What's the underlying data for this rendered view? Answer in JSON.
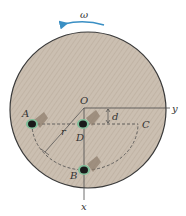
{
  "diagram": {
    "type": "rotating disk with bugs",
    "colors": {
      "disk_fill": "#c9bcae",
      "disk_edge": "#3a3a3a",
      "omega_arrow": "#3a8fc4",
      "lines": "#4a4a4a",
      "bug_body": "#1a1a1a",
      "bug_shadow": "#8b7a6a",
      "bug_legs": "#7fbf9a"
    },
    "labels": {
      "omega": "ω",
      "origin": "O",
      "y_axis": "y",
      "x_axis": "x",
      "distance": "d",
      "radius": "r",
      "point_a": "A",
      "point_b": "B",
      "point_c": "C",
      "point_d": "D"
    },
    "points": {
      "O": [
        84,
        108
      ],
      "A": [
        32,
        124
      ],
      "B": [
        84,
        170
      ],
      "C": [
        138,
        124
      ],
      "D": [
        83,
        124
      ]
    },
    "disk": {
      "cx": 88,
      "cy": 110,
      "r": 78
    }
  }
}
